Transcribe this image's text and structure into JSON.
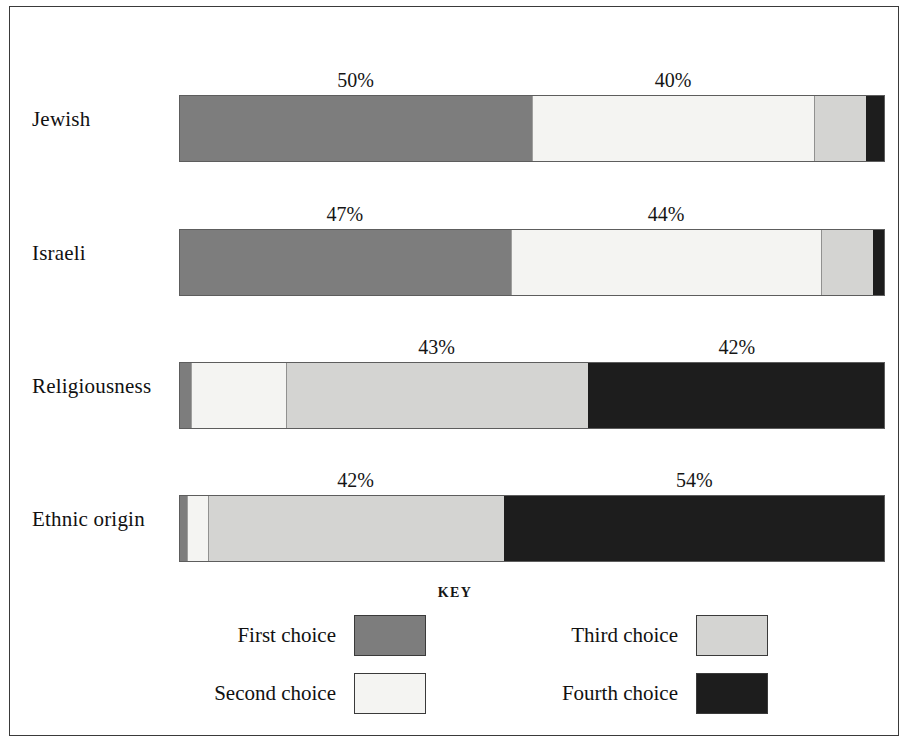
{
  "chart_data": {
    "type": "bar",
    "subtype": "horizontal-stacked-100pct",
    "title": "",
    "xlabel": "",
    "ylabel": "",
    "xlim": [
      0,
      100
    ],
    "grid": false,
    "legend_position": "bottom",
    "legend_title": "KEY",
    "categories": [
      "Jewish",
      "Israeli",
      "Religiousness",
      "Ethnic origin"
    ],
    "series": [
      {
        "name": "First choice",
        "color": "#7d7d7d",
        "values": [
          50,
          47,
          1.5,
          1
        ]
      },
      {
        "name": "Second choice",
        "color": "#f4f4f2",
        "values": [
          40,
          44,
          13.5,
          3
        ]
      },
      {
        "name": "Third choice",
        "color": "#d4d4d2",
        "values": [
          7.5,
          7.5,
          43,
          42
        ]
      },
      {
        "name": "Fourth choice",
        "color": "#1d1d1d",
        "values": [
          2.5,
          1.5,
          42,
          54
        ]
      }
    ],
    "annotations": [
      {
        "category": "Jewish",
        "series": "First choice",
        "text": "50%",
        "x_center": 25.0
      },
      {
        "category": "Jewish",
        "series": "Second choice",
        "text": "40%",
        "x_center": 70.0
      },
      {
        "category": "Israeli",
        "series": "First choice",
        "text": "47%",
        "x_center": 23.5
      },
      {
        "category": "Israeli",
        "series": "Second choice",
        "text": "44%",
        "x_center": 69.0
      },
      {
        "category": "Religiousness",
        "series": "Third choice",
        "text": "43%",
        "x_center": 36.5
      },
      {
        "category": "Religiousness",
        "series": "Fourth choice",
        "text": "42%",
        "x_center": 79.0
      },
      {
        "category": "Ethnic origin",
        "series": "Third choice",
        "text": "42%",
        "x_center": 25.0
      },
      {
        "category": "Ethnic origin",
        "series": "Fourth choice",
        "text": "54%",
        "x_center": 73.0
      }
    ]
  },
  "bars": [
    {
      "label": "Jewish",
      "top": 62,
      "segments": [
        {
          "key": "first",
          "pct": 50,
          "class": "s1"
        },
        {
          "key": "second",
          "pct": 40,
          "class": "s2"
        },
        {
          "key": "third",
          "pct": 7.5,
          "class": "s3"
        },
        {
          "key": "fourth",
          "pct": 2.5,
          "class": "s4"
        }
      ],
      "labels": [
        {
          "text": "50%",
          "left": 25.0
        },
        {
          "text": "40%",
          "left": 70.0
        }
      ]
    },
    {
      "label": "Israeli",
      "top": 196,
      "segments": [
        {
          "key": "first",
          "pct": 47,
          "class": "s1"
        },
        {
          "key": "second",
          "pct": 44,
          "class": "s2"
        },
        {
          "key": "third",
          "pct": 7.5,
          "class": "s3"
        },
        {
          "key": "fourth",
          "pct": 1.5,
          "class": "s4"
        }
      ],
      "labels": [
        {
          "text": "47%",
          "left": 23.5
        },
        {
          "text": "44%",
          "left": 69.0
        }
      ]
    },
    {
      "label": "Religiousness",
      "top": 329,
      "segments": [
        {
          "key": "first",
          "pct": 1.5,
          "class": "s1"
        },
        {
          "key": "second",
          "pct": 13.5,
          "class": "s2"
        },
        {
          "key": "third",
          "pct": 43,
          "class": "s3"
        },
        {
          "key": "fourth",
          "pct": 42,
          "class": "s4"
        }
      ],
      "labels": [
        {
          "text": "43%",
          "left": 36.5
        },
        {
          "text": "42%",
          "left": 79.0
        }
      ]
    },
    {
      "label": "Ethnic origin",
      "top": 462,
      "segments": [
        {
          "key": "first",
          "pct": 1,
          "class": "s1"
        },
        {
          "key": "second",
          "pct": 3,
          "class": "s2"
        },
        {
          "key": "third",
          "pct": 42,
          "class": "s3"
        },
        {
          "key": "fourth",
          "pct": 54,
          "class": "s4"
        }
      ],
      "labels": [
        {
          "text": "42%",
          "left": 25.0
        },
        {
          "text": "54%",
          "left": 73.0
        }
      ]
    }
  ],
  "legend": {
    "title": "KEY",
    "items": [
      {
        "label": "First choice",
        "swatch": "sw-first",
        "color": "#7d7d7d"
      },
      {
        "label": "Second choice",
        "swatch": "sw-second",
        "color": "#f4f4f2"
      },
      {
        "label": "Third choice",
        "swatch": "sw-third",
        "color": "#d4d4d2"
      },
      {
        "label": "Fourth choice",
        "swatch": "sw-fourth",
        "color": "#1d1d1d"
      }
    ]
  }
}
